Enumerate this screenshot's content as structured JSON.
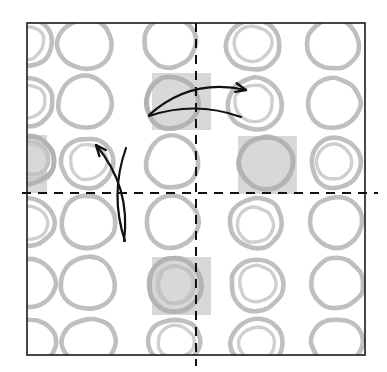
{
  "figure": {
    "canvas": {
      "width": 387,
      "height": 372,
      "background": "#ffffff"
    },
    "frame": {
      "name": "outer-square-border",
      "x": 27,
      "y": 23,
      "width": 338,
      "height": 332,
      "stroke": "#1a1a1a",
      "stroke_width": 1.6,
      "fill": "#ffffff"
    },
    "colors": {
      "motif_gray": "#bfbfbf",
      "motif_gray_light": "#cfcfcf",
      "highlight_square": "#c9c9c9",
      "axis_black": "#111111",
      "arrow_black": "#111111",
      "frame_black": "#1a1a1a",
      "page_white": "#ffffff"
    },
    "axes": [
      {
        "name": "vertical-dashed-axis",
        "orientation": "vertical",
        "x": 196,
        "y1": 23,
        "y2": 366,
        "dash": "9 7",
        "stroke": "#111111",
        "stroke_width": 2.0
      },
      {
        "name": "horizontal-dashed-axis",
        "orientation": "horizontal",
        "y": 193,
        "x1": 22,
        "x2": 378,
        "dash": "9 7",
        "stroke": "#111111",
        "stroke_width": 2.0
      }
    ],
    "grid": {
      "columns": 6,
      "rows": 6,
      "cell_width": 58,
      "cell_height": 56,
      "origin_x": 10,
      "origin_y": 14
    },
    "highlight_squares": [
      {
        "name": "highlight-square-top-center",
        "x": 152,
        "y": 73,
        "width": 59,
        "height": 57
      },
      {
        "name": "highlight-square-mid-left",
        "x": 22,
        "y": 135,
        "width": 25,
        "height": 58
      },
      {
        "name": "highlight-square-mid-right",
        "x": 238,
        "y": 136,
        "width": 59,
        "height": 58
      },
      {
        "name": "highlight-square-bottom-center",
        "x": 152,
        "y": 257,
        "width": 59,
        "height": 58
      }
    ],
    "motifs": [
      {
        "name": "ring-motif",
        "cx": 27,
        "cy": 42,
        "rx": 25,
        "ry": 24,
        "double": true
      },
      {
        "name": "ring-motif",
        "cx": 85,
        "cy": 44,
        "rx": 27,
        "ry": 25,
        "double": false
      },
      {
        "name": "ring-motif",
        "cx": 170,
        "cy": 42,
        "rx": 26,
        "ry": 25,
        "double": false
      },
      {
        "name": "ring-motif",
        "cx": 253,
        "cy": 45,
        "rx": 27,
        "ry": 25,
        "double": true
      },
      {
        "name": "ring-motif",
        "cx": 333,
        "cy": 44,
        "rx": 26,
        "ry": 25,
        "double": false
      },
      {
        "name": "ring-motif",
        "cx": 28,
        "cy": 102,
        "rx": 25,
        "ry": 24,
        "double": true
      },
      {
        "name": "ring-motif",
        "cx": 85,
        "cy": 102,
        "rx": 27,
        "ry": 26,
        "double": false
      },
      {
        "name": "ring-motif",
        "cx": 172,
        "cy": 103,
        "rx": 26,
        "ry": 26,
        "double": false
      },
      {
        "name": "ring-motif",
        "cx": 255,
        "cy": 104,
        "rx": 27,
        "ry": 26,
        "double": true
      },
      {
        "name": "ring-motif",
        "cx": 334,
        "cy": 103,
        "rx": 26,
        "ry": 25,
        "double": false
      },
      {
        "name": "ring-motif",
        "cx": 29,
        "cy": 160,
        "rx": 25,
        "ry": 24,
        "double": true
      },
      {
        "name": "ring-motif",
        "cx": 87,
        "cy": 163,
        "rx": 26,
        "ry": 25,
        "double": true
      },
      {
        "name": "ring-motif",
        "cx": 172,
        "cy": 162,
        "rx": 26,
        "ry": 26,
        "double": false
      },
      {
        "name": "ring-motif",
        "cx": 266,
        "cy": 163,
        "rx": 27,
        "ry": 26,
        "double": false
      },
      {
        "name": "ring-motif",
        "cx": 336,
        "cy": 163,
        "rx": 25,
        "ry": 25,
        "double": true
      },
      {
        "name": "ring-motif",
        "cx": 29,
        "cy": 222,
        "rx": 25,
        "ry": 24,
        "double": true
      },
      {
        "name": "ring-motif",
        "cx": 88,
        "cy": 222,
        "rx": 27,
        "ry": 26,
        "double": false
      },
      {
        "name": "ring-motif",
        "cx": 172,
        "cy": 222,
        "rx": 26,
        "ry": 26,
        "double": false
      },
      {
        "name": "ring-motif",
        "cx": 256,
        "cy": 223,
        "rx": 26,
        "ry": 25,
        "double": true
      },
      {
        "name": "ring-motif",
        "cx": 336,
        "cy": 222,
        "rx": 26,
        "ry": 25,
        "double": false
      },
      {
        "name": "ring-motif",
        "cx": 30,
        "cy": 283,
        "rx": 25,
        "ry": 24,
        "double": false
      },
      {
        "name": "ring-motif",
        "cx": 88,
        "cy": 283,
        "rx": 27,
        "ry": 26,
        "double": false
      },
      {
        "name": "ring-motif",
        "cx": 175,
        "cy": 285,
        "rx": 26,
        "ry": 27,
        "double": true
      },
      {
        "name": "ring-motif",
        "cx": 257,
        "cy": 285,
        "rx": 26,
        "ry": 26,
        "double": true
      },
      {
        "name": "ring-motif",
        "cx": 337,
        "cy": 283,
        "rx": 26,
        "ry": 25,
        "double": false
      },
      {
        "name": "ring-motif",
        "cx": 31,
        "cy": 342,
        "rx": 25,
        "ry": 22,
        "double": false
      },
      {
        "name": "ring-motif",
        "cx": 89,
        "cy": 342,
        "rx": 27,
        "ry": 23,
        "double": false
      },
      {
        "name": "ring-motif",
        "cx": 174,
        "cy": 342,
        "rx": 26,
        "ry": 23,
        "double": true
      },
      {
        "name": "ring-motif",
        "cx": 257,
        "cy": 342,
        "rx": 26,
        "ry": 23,
        "double": true
      },
      {
        "name": "ring-motif",
        "cx": 337,
        "cy": 342,
        "rx": 26,
        "ry": 23,
        "double": false
      }
    ],
    "arrows": [
      {
        "name": "translation-arrow-horizontal",
        "direction": "rightward",
        "from": {
          "x": 149,
          "y": 115
        },
        "to": {
          "x": 246,
          "y": 90
        },
        "stroke": "#111111",
        "stroke_width": 2.2,
        "arrowheads": 1
      },
      {
        "name": "translation-arrow-horizontal-return",
        "direction": "rightward-lower",
        "from": {
          "x": 149,
          "y": 116
        },
        "to": {
          "x": 241,
          "y": 117
        },
        "stroke": "#111111",
        "stroke_width": 2.2,
        "arrowheads": 0
      },
      {
        "name": "translation-arrow-vertical",
        "direction": "upward",
        "from": {
          "x": 124,
          "y": 241
        },
        "to": {
          "x": 96,
          "y": 145
        },
        "stroke": "#111111",
        "stroke_width": 2.2,
        "arrowheads": 1
      },
      {
        "name": "translation-arrow-vertical-return",
        "direction": "upward-right",
        "from": {
          "x": 125,
          "y": 241
        },
        "to": {
          "x": 126,
          "y": 148
        },
        "stroke": "#111111",
        "stroke_width": 2.2,
        "arrowheads": 0
      }
    ]
  }
}
